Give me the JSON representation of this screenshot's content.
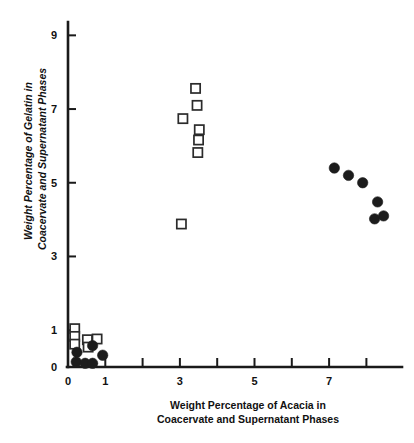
{
  "chart_data": {
    "type": "scatter",
    "title": "",
    "xlabel": "Weight Percentage of Acacia in Coacervate and Supernatant Phases",
    "ylabel": "Weight Percentage of Gelatin in Coacervate and Supernatant Phases",
    "xlabel_line1": "Weight Percentage of Acacia in",
    "xlabel_line2": "Coacervate and Supernatant Phases",
    "ylabel_line1": "Weight Percentage of Gelatin in",
    "ylabel_line2": "Coacervate and Supernatant Phases",
    "xlim": [
      0,
      8.6
    ],
    "ylim": [
      0,
      9.4
    ],
    "x_ticks_major": [
      0,
      1,
      3,
      5,
      7
    ],
    "x_ticks_major_labels": [
      "0",
      "1",
      "3",
      "5",
      "7"
    ],
    "x_ticks_minor": [
      2,
      4,
      6,
      8
    ],
    "y_ticks_major": [
      0,
      1,
      3,
      5,
      7,
      9
    ],
    "y_ticks_major_labels": [
      "0",
      "1",
      "3",
      "5",
      "7",
      "9"
    ],
    "grid": false,
    "legend": null,
    "legend_position": "none",
    "series": [
      {
        "name": "open-squares",
        "marker": "open-square",
        "color": "#2b2b2b",
        "points": [
          [
            0.18,
            1.04
          ],
          [
            0.18,
            0.83
          ],
          [
            0.18,
            0.62
          ],
          [
            0.52,
            0.74
          ],
          [
            0.54,
            0.54
          ],
          [
            0.78,
            0.76
          ],
          [
            3.04,
            3.88
          ],
          [
            3.08,
            6.74
          ],
          [
            3.42,
            7.56
          ],
          [
            3.46,
            7.1
          ],
          [
            3.52,
            6.44
          ],
          [
            3.5,
            6.16
          ],
          [
            3.48,
            5.82
          ]
        ]
      },
      {
        "name": "filled-circles",
        "marker": "filled-circle",
        "color": "#1c1c1c",
        "points": [
          [
            0.24,
            0.4
          ],
          [
            0.22,
            0.14
          ],
          [
            0.46,
            0.1
          ],
          [
            0.66,
            0.1
          ],
          [
            0.66,
            0.58
          ],
          [
            0.93,
            0.32
          ],
          [
            7.14,
            5.4
          ],
          [
            7.52,
            5.2
          ],
          [
            7.9,
            5.0
          ],
          [
            8.3,
            4.48
          ],
          [
            8.22,
            4.02
          ],
          [
            8.46,
            4.1
          ]
        ]
      }
    ]
  }
}
